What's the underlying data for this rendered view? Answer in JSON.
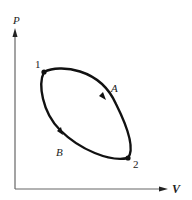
{
  "diagram": {
    "type": "PV cycle diagram",
    "axes": {
      "y_label": "P",
      "x_label": "V"
    },
    "points": [
      {
        "id": "point-1",
        "label": "1"
      },
      {
        "id": "point-2",
        "label": "2"
      }
    ],
    "paths": [
      {
        "id": "path-A",
        "label": "A",
        "direction": "1 to 2 (upper)"
      },
      {
        "id": "path-B",
        "label": "B",
        "direction": "1 to 2 (lower)"
      }
    ],
    "colors": {
      "curve": "#111111",
      "axis": "#555555",
      "text": "#222222"
    }
  }
}
